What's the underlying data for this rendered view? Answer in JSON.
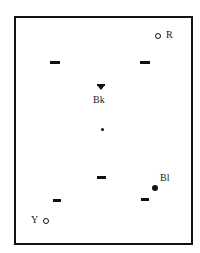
{
  "diagram": {
    "type": "station-layout",
    "frame": {
      "stroke_color": "#111111"
    },
    "markers": [
      {
        "id": "R",
        "label": "R",
        "shape": "open-circle",
        "x": 158,
        "y": 36
      },
      {
        "id": "Bk",
        "label": "Bk",
        "shape": "filled-triangle-down",
        "x": 101,
        "y": 87
      },
      {
        "id": "center",
        "label": "",
        "shape": "small-dot",
        "x": 102,
        "y": 129
      },
      {
        "id": "Bl",
        "label": "Bl",
        "shape": "filled-circle",
        "x": 155,
        "y": 188
      },
      {
        "id": "Y",
        "label": "Y",
        "shape": "open-circle",
        "x": 46,
        "y": 221
      }
    ],
    "dashes": [
      {
        "x": 50,
        "y": 61
      },
      {
        "x": 140,
        "y": 61
      },
      {
        "x": 97,
        "y": 176
      },
      {
        "x": 53,
        "y": 199
      },
      {
        "x": 140,
        "y": 198
      }
    ]
  }
}
